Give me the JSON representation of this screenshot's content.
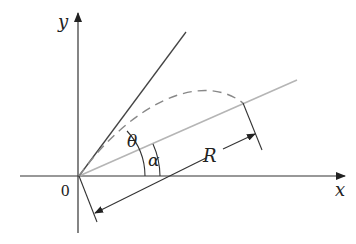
{
  "diagram": {
    "type": "projectile-on-inclined-plane",
    "labels": {
      "x_axis": "x",
      "y_axis": "y",
      "origin": "0",
      "launch_angle": "θ",
      "incline_angle": "α",
      "range": "R"
    },
    "colors": {
      "axes": "#333333",
      "launch_line": "#444444",
      "incline_line": "#b5b5b5",
      "trajectory": "#888888",
      "dimension": "#333333",
      "background": "#ffffff"
    }
  }
}
